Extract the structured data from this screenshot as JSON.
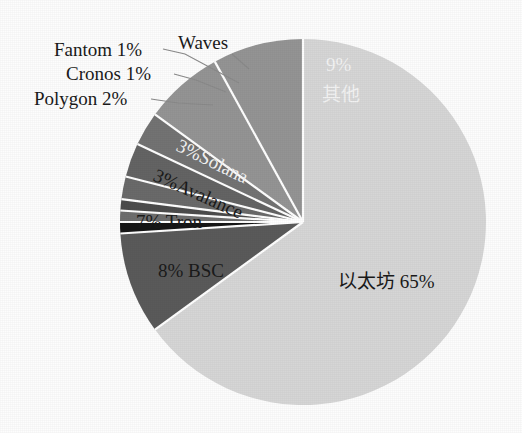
{
  "chart_data": {
    "type": "pie",
    "title": "",
    "subtitle": "",
    "xlabel": "",
    "ylabel": "",
    "legend_position": "none",
    "grid": false,
    "start_angle_deg": 0,
    "direction": "clockwise",
    "categories": [
      "以太坊",
      "其他",
      "Waves",
      "Fantom",
      "Cronos",
      "Polygon",
      "Solana",
      "Avalance",
      "Tron",
      "BSC"
    ],
    "values": [
      65,
      9,
      1,
      1,
      1,
      2,
      3,
      3,
      7,
      8
    ],
    "units": "%",
    "slices": [
      {
        "name": "以太坊",
        "value": 65,
        "label_text": "以太坊 65%",
        "color": "#d6d6d6",
        "text_color": "#1a1a1a",
        "label_placement": "inside",
        "label_x": 338,
        "label_y": 288
      },
      {
        "name": "其他",
        "value": 9,
        "label_text": "9%",
        "label_text2": "其他",
        "color": "#5a5a5a",
        "text_color": "#f2f2f2",
        "label_placement": "inside",
        "label_x": 326,
        "label_y": 71,
        "label2_x": 322,
        "label2_y": 101
      },
      {
        "name": "Waves",
        "value": 1,
        "label_text": "Waves",
        "color": "#161616",
        "text_color": "#1a1a1a",
        "label_placement": "callout",
        "label_x": 178,
        "label_y": 49,
        "leader": "M 232 54 L 249 69"
      },
      {
        "name": "Fantom",
        "value": 1,
        "label_text": "Fantom 1%",
        "color": "#6e6e6e",
        "text_color": "#1a1a1a",
        "label_placement": "callout",
        "label_x": 54,
        "label_y": 56,
        "leader": "M 163 49 L 185 54 L 239 83"
      },
      {
        "name": "Cronos",
        "value": 1,
        "label_text": "Cronos 1%",
        "color": "#4c4c4c",
        "text_color": "#1a1a1a",
        "label_placement": "callout",
        "label_x": 66,
        "label_y": 80,
        "leader": "M 174 74 L 196 80 L 226 92"
      },
      {
        "name": "Polygon",
        "value": 2,
        "label_text": "Polygon 2%",
        "color": "#6a6a6a",
        "text_color": "#1a1a1a",
        "label_placement": "callout",
        "label_x": 34,
        "label_y": 105,
        "leader": "M 151 99 L 178 103 L 213 105"
      },
      {
        "name": "Solana",
        "value": 3,
        "label_text": "3%Solana",
        "color": "#646464",
        "text_color": "#f2f2f2",
        "label_placement": "inside",
        "label_x": 175,
        "label_y": 150,
        "rotation": 26
      },
      {
        "name": "Avalance",
        "value": 3,
        "label_text": "3%Avalance",
        "color": "#737373",
        "text_color": "#1a1a1a",
        "label_placement": "inside",
        "label_x": 152,
        "label_y": 180,
        "rotation": 24
      },
      {
        "name": "Tron",
        "value": 7,
        "label_text": "7%  Tron",
        "color": "#949494",
        "text_color": "#1a1a1a",
        "label_placement": "inside",
        "label_x": 136,
        "label_y": 228
      },
      {
        "name": "BSC",
        "value": 8,
        "label_text": "8% BSC",
        "color": "#949494",
        "text_color": "#1a1a1a",
        "label_placement": "inside",
        "label_x": 158,
        "label_y": 277
      }
    ],
    "geometry": {
      "center_x": 303,
      "center_y": 222,
      "radius": 183
    },
    "background_color": "#fdfdfd"
  }
}
